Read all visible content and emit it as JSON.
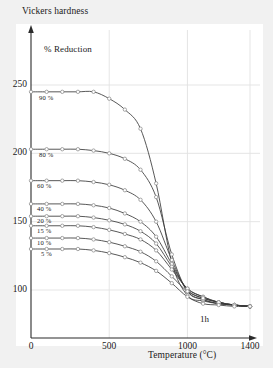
{
  "chart_data": {
    "type": "line",
    "title": "Vickers hardness",
    "xlabel": "Temperature (°C)",
    "ylabel": "Vickers hardness",
    "legend_title": "% Reduction",
    "annotation": "1h",
    "grid": true,
    "legend_position": "inline-left-of-curves",
    "xlim": [
      0,
      1400
    ],
    "ylim": [
      75,
      262
    ],
    "xticks": [
      0,
      500,
      1000,
      1400
    ],
    "xtick_labels": [
      "0",
      "500",
      "1000",
      "1400"
    ],
    "yticks": [
      100,
      150,
      200,
      250
    ],
    "ytick_labels": [
      "100",
      "150",
      "200",
      "250"
    ],
    "x": [
      0,
      100,
      200,
      300,
      400,
      500,
      600,
      700,
      800,
      900,
      1000,
      1100,
      1200,
      1300,
      1400
    ],
    "series": [
      {
        "name": "90%",
        "label": "90 %",
        "values": [
          245,
          245,
          245,
          245,
          245,
          240,
          232,
          218,
          178,
          120,
          96,
          92,
          90,
          89,
          88
        ]
      },
      {
        "name": "80%",
        "label": "80 %",
        "values": [
          203,
          203,
          203,
          203,
          202,
          200,
          196,
          188,
          168,
          126,
          99,
          93,
          90,
          89,
          88
        ]
      },
      {
        "name": "60%",
        "label": "60 %",
        "values": [
          180,
          180,
          180,
          180,
          179,
          177,
          173,
          166,
          150,
          122,
          99,
          93,
          90,
          89,
          88
        ]
      },
      {
        "name": "40%",
        "label": "40 %",
        "values": [
          163,
          163,
          163,
          163,
          162,
          160,
          156,
          150,
          139,
          119,
          100,
          94,
          91,
          89,
          88
        ]
      },
      {
        "name": "20%",
        "label": "20 %",
        "values": [
          154,
          154,
          154,
          154,
          153,
          151,
          148,
          143,
          134,
          117,
          101,
          95,
          91,
          89,
          88
        ]
      },
      {
        "name": "15%",
        "label": "15 %",
        "values": [
          147,
          147,
          147,
          147,
          146,
          144,
          141,
          137,
          129,
          115,
          101,
          95,
          91,
          89,
          88
        ]
      },
      {
        "name": "10%",
        "label": "10 %",
        "values": [
          138,
          138,
          138,
          138,
          137,
          135,
          132,
          128,
          121,
          110,
          99,
          94,
          91,
          89,
          88
        ]
      },
      {
        "name": "5%",
        "label": "5 %",
        "values": [
          130,
          130,
          130,
          130,
          129,
          127,
          124,
          120,
          114,
          105,
          95,
          90,
          89,
          88,
          88
        ]
      }
    ]
  },
  "chart": {
    "axis_title_y": "Vickers hardness",
    "axis_title_x": "Temperature (°C)",
    "legend_title": "% Reduction",
    "annotation": "1h",
    "colors": {
      "line": "#3a3a3a",
      "marker_fill": "#ffffff",
      "marker_stroke": "#8a8a8a",
      "grid": "#e2e2e2",
      "axis": "#2b2b2b",
      "plot_background": "#ffffff",
      "page_background": "#f1f1f1"
    }
  }
}
